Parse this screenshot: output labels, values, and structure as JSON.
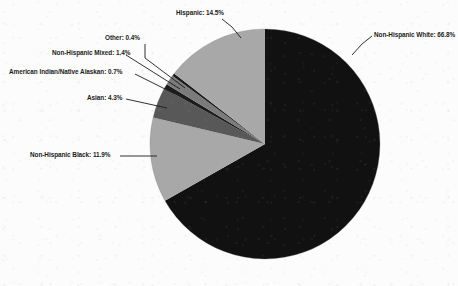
{
  "figure": {
    "background_color": "#fcfcfc",
    "text_color": "#1b1b1b"
  },
  "chart_data": {
    "type": "pie",
    "title": "",
    "xlabel": "",
    "ylabel": "",
    "legend_position": "none",
    "grid": false,
    "start_angle_deg": 90,
    "direction": "clockwise",
    "units": "percent",
    "total": 100.0,
    "categories": [
      "Non-Hispanic White",
      "Non-Hispanic Black",
      "Asian",
      "American Indian/Native Alaskan",
      "Non-Hispanic Mixed",
      "Other",
      "Hispanic"
    ],
    "values": [
      66.8,
      11.9,
      4.3,
      0.7,
      1.4,
      0.4,
      14.5
    ],
    "colors": [
      "#111111",
      "#a8a8a8",
      "#585858",
      "#1c1c1c",
      "#7b7b7b",
      "#1c1c1c",
      "#a8a8a8"
    ],
    "labels": [
      "Non-Hispanic White: 66.8%",
      "Non-Hispanic Black: 11.9%",
      "Asian: 4.3%",
      "American Indian/Native Alaskan: 0.7%",
      "Non-Hispanic Mixed: 1.4%",
      "Other: 0.4%",
      "Hispanic: 14.5%"
    ],
    "slices": [
      {
        "name": "Non-Hispanic White",
        "value": 66.8,
        "label": "Non-Hispanic White: 66.8%",
        "color": "#111111"
      },
      {
        "name": "Non-Hispanic Black",
        "value": 11.9,
        "label": "Non-Hispanic Black: 11.9%",
        "color": "#a8a8a8"
      },
      {
        "name": "Asian",
        "value": 4.3,
        "label": "Asian: 4.3%",
        "color": "#585858"
      },
      {
        "name": "American Indian/Native Alaskan",
        "value": 0.7,
        "label": "American Indian/Native Alaskan: 0.7%",
        "color": "#1c1c1c"
      },
      {
        "name": "Non-Hispanic Mixed",
        "value": 1.4,
        "label": "Non-Hispanic Mixed: 1.4%",
        "color": "#7b7b7b"
      },
      {
        "name": "Other",
        "value": 0.4,
        "label": "Other: 0.4%",
        "color": "#1c1c1c"
      },
      {
        "name": "Hispanic",
        "value": 14.5,
        "label": "Hispanic: 14.5%",
        "color": "#a8a8a8"
      }
    ]
  }
}
